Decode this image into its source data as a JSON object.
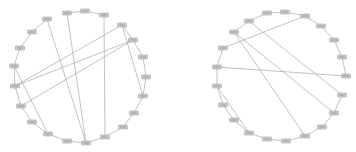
{
  "graphs": [
    {
      "name": "left-circular-graph",
      "nodes": [
        [
          67,
          13
        ],
        [
          85,
          11
        ],
        [
          104,
          15
        ],
        [
          122,
          25
        ],
        [
          133,
          40
        ],
        [
          143,
          57
        ],
        [
          146,
          77
        ],
        [
          143,
          96
        ],
        [
          134,
          113
        ],
        [
          123,
          127
        ],
        [
          105,
          137
        ],
        [
          86,
          143
        ],
        [
          67,
          141
        ],
        [
          48,
          134
        ],
        [
          32,
          122
        ],
        [
          21,
          106
        ],
        [
          15,
          86
        ],
        [
          14,
          66
        ],
        [
          20,
          48
        ],
        [
          32,
          32
        ],
        [
          47,
          19
        ]
      ],
      "ring_edges": [
        [
          0,
          1
        ],
        [
          1,
          2
        ],
        [
          3,
          4
        ],
        [
          4,
          5
        ],
        [
          5,
          6
        ],
        [
          6,
          7
        ],
        [
          7,
          8
        ],
        [
          8,
          9
        ],
        [
          9,
          10
        ],
        [
          10,
          11
        ],
        [
          11,
          12
        ],
        [
          12,
          13
        ],
        [
          13,
          14
        ],
        [
          14,
          15
        ],
        [
          15,
          16
        ],
        [
          16,
          17
        ],
        [
          17,
          18
        ],
        [
          18,
          19
        ],
        [
          19,
          20
        ],
        [
          3,
          7
        ]
      ],
      "chords": [
        [
          20,
          11
        ],
        [
          0,
          11
        ],
        [
          2,
          10
        ],
        [
          3,
          16
        ],
        [
          4,
          16
        ],
        [
          4,
          15
        ],
        [
          17,
          13
        ]
      ]
    },
    {
      "name": "right-circular-graph",
      "nodes": [
        [
          267,
          13
        ],
        [
          285,
          12
        ],
        [
          305,
          16
        ],
        [
          321,
          26
        ],
        [
          334,
          40
        ],
        [
          342,
          57
        ],
        [
          346,
          76
        ],
        [
          342,
          95
        ],
        [
          334,
          113
        ],
        [
          322,
          127
        ],
        [
          305,
          136
        ],
        [
          286,
          141
        ],
        [
          267,
          139
        ],
        [
          249,
          133
        ],
        [
          234,
          120
        ],
        [
          223,
          105
        ],
        [
          217,
          86
        ],
        [
          217,
          67
        ],
        [
          223,
          48
        ],
        [
          234,
          32
        ],
        [
          249,
          21
        ]
      ],
      "ring_edges": [
        [
          0,
          1
        ],
        [
          1,
          2
        ],
        [
          2,
          3
        ],
        [
          3,
          4
        ],
        [
          4,
          5
        ],
        [
          5,
          6
        ],
        [
          7,
          8
        ],
        [
          8,
          9
        ],
        [
          9,
          10
        ],
        [
          10,
          11
        ],
        [
          11,
          12
        ],
        [
          12,
          13
        ],
        [
          13,
          14
        ],
        [
          14,
          15
        ],
        [
          15,
          16
        ],
        [
          16,
          17
        ],
        [
          17,
          18
        ],
        [
          19,
          20
        ],
        [
          20,
          0
        ]
      ],
      "chords": [
        [
          19,
          10
        ],
        [
          19,
          8
        ],
        [
          20,
          7
        ],
        [
          18,
          2
        ],
        [
          17,
          6
        ],
        [
          16,
          13
        ]
      ]
    }
  ],
  "colors": {
    "edge": "#9a9a9a",
    "node_fill": "#d4d4d4",
    "node_stroke": "#8a8a8a"
  }
}
